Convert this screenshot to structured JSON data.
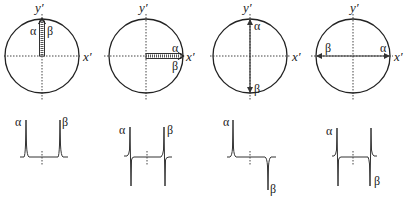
{
  "figure": {
    "panels": [
      {
        "id": "panel-1",
        "axis_x_label": "x′",
        "axis_y_label": "y′",
        "vector_orientation": "both along +y′ (parallel, overlapping)",
        "alpha_label": "α",
        "beta_label": "β",
        "spectrum": "two positive absorption peaks",
        "spectrum_alpha_label": "α",
        "spectrum_beta_label": "β"
      },
      {
        "id": "panel-2",
        "axis_x_label": "x′",
        "axis_y_label": "y′",
        "vector_orientation": "both along +x′ (parallel, overlapping)",
        "alpha_label": "α",
        "beta_label": "β",
        "spectrum": "two dispersion-shaped peaks",
        "spectrum_alpha_label": "α",
        "spectrum_beta_label": "β"
      },
      {
        "id": "panel-3",
        "axis_x_label": "x′",
        "axis_y_label": "y′",
        "vector_orientation": "α along +y′, β along −y′ (antiparallel)",
        "alpha_label": "α",
        "beta_label": "β",
        "spectrum": "α positive absorption, β negative absorption",
        "spectrum_alpha_label": "α",
        "spectrum_beta_label": "β"
      },
      {
        "id": "panel-4",
        "axis_x_label": "x′",
        "axis_y_label": "y′",
        "vector_orientation": "α along +x′, β along −x′ (antiparallel)",
        "alpha_label": "α",
        "beta_label": "β",
        "spectrum": "α dispersion, β inverted dispersion",
        "spectrum_alpha_label": "α",
        "spectrum_beta_label": "β"
      }
    ]
  }
}
